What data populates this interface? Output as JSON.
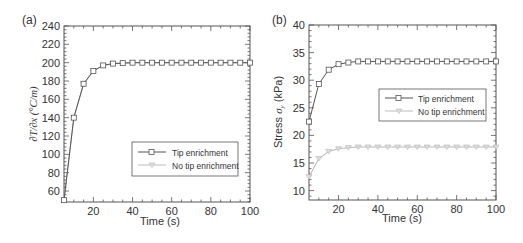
{
  "chart_data": [
    {
      "type": "line",
      "panel_label": "(a)",
      "title": "",
      "xlabel": "Time (s)",
      "ylabel": "∂T/∂x (°C/m)",
      "xlim": [
        5,
        100
      ],
      "ylim": [
        48,
        240
      ],
      "xticks": [
        20,
        40,
        60,
        80,
        100
      ],
      "yticks": [
        60,
        80,
        100,
        120,
        140,
        160,
        180,
        200,
        220,
        240
      ],
      "grid": false,
      "legend_position": "lower right (inside)",
      "x": [
        5,
        10,
        15,
        20,
        25,
        30,
        35,
        40,
        45,
        50,
        55,
        60,
        65,
        70,
        75,
        80,
        85,
        90,
        95,
        100
      ],
      "series": [
        {
          "name": "Tip enrichment",
          "marker": "square",
          "color": "#555555",
          "values": [
            50,
            140,
            177,
            191,
            197,
            199,
            199.5,
            200,
            200,
            200,
            200,
            200,
            200,
            200,
            200,
            200,
            200,
            200,
            200,
            200
          ]
        },
        {
          "name": "No tip enrichment",
          "marker": "triangle-down",
          "color": "#b0b0b0",
          "values": [
            50,
            140,
            177,
            191,
            197,
            199,
            199.5,
            200,
            200,
            200,
            200,
            200,
            200,
            200,
            200,
            200,
            200,
            200,
            200,
            200
          ]
        }
      ]
    },
    {
      "type": "line",
      "panel_label": "(b)",
      "title": "",
      "xlabel": "Time (s)",
      "ylabel": "Stress σy (kPa)",
      "xlim": [
        5,
        100
      ],
      "ylim": [
        8.3,
        40
      ],
      "xticks": [
        20,
        40,
        60,
        80,
        100
      ],
      "yticks": [
        10,
        15,
        20,
        25,
        30,
        35,
        40
      ],
      "grid": false,
      "legend_position": "center right (inside)",
      "x": [
        5,
        10,
        15,
        20,
        25,
        30,
        35,
        40,
        45,
        50,
        55,
        60,
        65,
        70,
        75,
        80,
        85,
        90,
        95,
        100
      ],
      "series": [
        {
          "name": "Tip enrichment",
          "marker": "square",
          "color": "#555555",
          "values": [
            22.5,
            29.3,
            31.9,
            32.9,
            33.2,
            33.4,
            33.4,
            33.4,
            33.4,
            33.4,
            33.4,
            33.4,
            33.4,
            33.4,
            33.4,
            33.4,
            33.4,
            33.4,
            33.4,
            33.4
          ]
        },
        {
          "name": "No tip enrichment",
          "marker": "triangle-down",
          "color": "#b5b5b5",
          "values": [
            12.5,
            15.8,
            17.1,
            17.6,
            17.8,
            17.9,
            17.9,
            17.9,
            17.9,
            17.9,
            17.9,
            17.9,
            17.9,
            17.9,
            17.9,
            17.9,
            17.9,
            17.9,
            17.9,
            17.9
          ]
        }
      ]
    }
  ]
}
